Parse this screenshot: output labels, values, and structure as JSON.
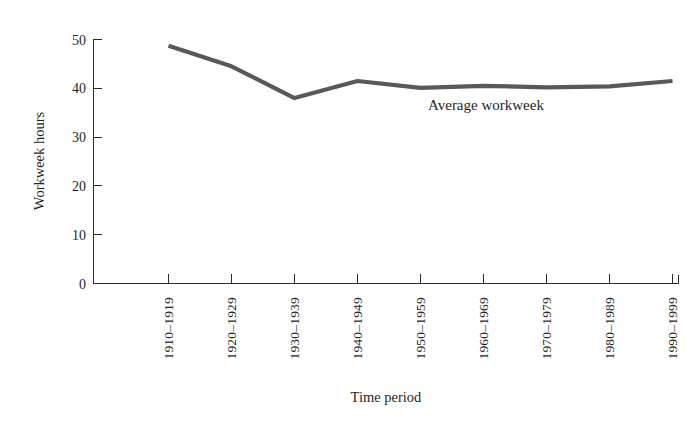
{
  "chart_data": {
    "type": "line",
    "title": "",
    "subtitle": "",
    "xlabel": "Time period",
    "ylabel": "Workweek hours",
    "categories": [
      "1910–1919",
      "1920–1929",
      "1930–1939",
      "1940–1949",
      "1950–1959",
      "1960–1969",
      "1970–1979",
      "1980–1989",
      "1990–1999"
    ],
    "series": [
      {
        "name": "Average workweek",
        "values": [
          48.7,
          44.5,
          38.0,
          41.5,
          40.1,
          40.5,
          40.2,
          40.4,
          41.5
        ],
        "color": "#595959"
      }
    ],
    "annotations": [
      {
        "text": "Average workweek",
        "x_category": "1950–1959",
        "y_value": 35.5
      }
    ],
    "ylim": [
      0,
      50
    ],
    "yticks": [
      0,
      10,
      20,
      30,
      40,
      50
    ],
    "ytick_labels": [
      "0",
      "10",
      "20",
      "30",
      "40",
      "50"
    ],
    "grid": false,
    "legend": "none",
    "legend_position": "inline-annotation",
    "axis_color": "#2b2b2b",
    "background_color": "#ffffff"
  },
  "axes": {
    "y_title": "Workweek hours",
    "x_title": "Time period"
  },
  "ticks": {
    "y": [
      "0",
      "10",
      "20",
      "30",
      "40",
      "50"
    ],
    "x": [
      "1910–1919",
      "1920–1929",
      "1930–1939",
      "1940–1949",
      "1950–1959",
      "1960–1969",
      "1970–1979",
      "1980–1989",
      "1990–1999"
    ]
  },
  "annotation": {
    "series_label": "Average workweek"
  }
}
